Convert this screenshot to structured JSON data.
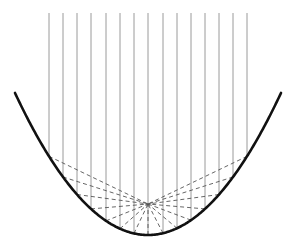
{
  "diagram": {
    "title": "",
    "colors": {
      "background": "#ffffff",
      "parabola": "#111111",
      "incident_rays": "#9a9a9a",
      "reflected_rays": "#555555"
    },
    "parabola": {
      "vertex": [
        148,
        235
      ],
      "a": 0.00803,
      "x_range": [
        15,
        281
      ],
      "stroke_width": 2.6
    },
    "focus": [
      148,
      204
    ],
    "incident_rays": {
      "top_y": 13,
      "x_positions": [
        49,
        63,
        77,
        91,
        106,
        120,
        134,
        148,
        163,
        177,
        191,
        205,
        219,
        233,
        247
      ]
    },
    "reflected_rays": {
      "dash": "4,3"
    }
  }
}
